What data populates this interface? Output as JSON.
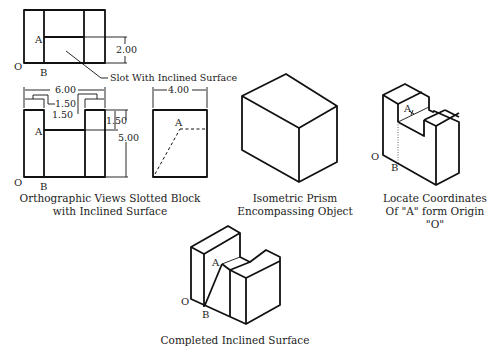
{
  "orthographic": {
    "caption_line1": "Orthographic Views Slotted Block",
    "caption_line2": "with Inclined Surface",
    "callout": "Slot With Inclined Surface",
    "labels": {
      "A_top": "A",
      "O_top": "O",
      "B_top": "B",
      "A_front": "A",
      "O_front": "O",
      "B_front": "B",
      "A_side": "A"
    },
    "dimensions": {
      "top_height": "2.00",
      "overall_width": "6.00",
      "slot_offset_1": "1.50",
      "slot_offset_2": "1.50",
      "slot_depth": "1.50",
      "overall_height": "5.00",
      "side_width": "4.00"
    }
  },
  "isometric_prism": {
    "caption_line1": "Isometric Prism",
    "caption_line2": "Encompassing Object"
  },
  "locate_coordinates": {
    "caption_line1": "Locate Coordinates",
    "caption_line2": "Of \"A\" form Origin \"O\"",
    "labels": {
      "A": "A",
      "O": "O",
      "B": "B"
    }
  },
  "completed": {
    "caption": "Completed Inclined Surface",
    "labels": {
      "A": "A",
      "O": "O",
      "B": "B"
    }
  }
}
